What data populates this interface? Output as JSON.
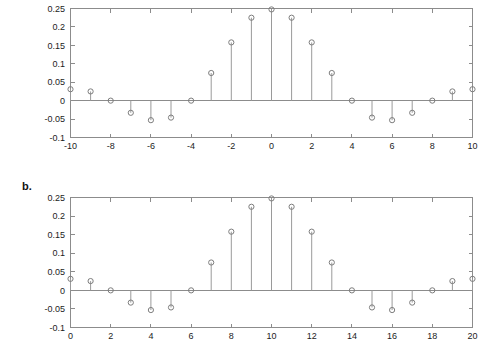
{
  "figure": {
    "background": "#ffffff",
    "axis_color": "#8c8c8c",
    "stem_color": "#9a9a9a",
    "marker_color": "#7d7d7d",
    "text_color": "#1c1c1c"
  },
  "panels": [
    {
      "id": "panel-a",
      "label": "",
      "chart_index": 0
    },
    {
      "id": "panel-b",
      "label": "b.",
      "chart_index": 1
    }
  ],
  "chart_data": [
    {
      "type": "scatter",
      "subtype": "stem",
      "title": "",
      "xlabel": "",
      "ylabel": "",
      "xlim": [
        -10,
        10
      ],
      "ylim": [
        -0.1,
        0.25
      ],
      "grid": false,
      "legend": null,
      "xticks": [
        -10,
        -8,
        -6,
        -4,
        -2,
        0,
        2,
        4,
        6,
        8,
        10
      ],
      "xticklabels": [
        "-10",
        "-8",
        "-6",
        "-4",
        "-2",
        "0",
        "2",
        "4",
        "6",
        "8",
        "10"
      ],
      "xminorticks": [
        -9,
        -7,
        -5,
        -3,
        -1,
        1,
        3,
        5,
        7,
        9
      ],
      "yticks": [
        -0.1,
        -0.05,
        0,
        0.05,
        0.1,
        0.15,
        0.2,
        0.25
      ],
      "yticklabels": [
        "-0.1",
        "-0.05",
        "0",
        "0.05",
        "0.1",
        "0.15",
        "0.2",
        "0.25"
      ],
      "x": [
        -10,
        -9,
        -8,
        -7,
        -6,
        -5,
        -4,
        -3,
        -2,
        -1,
        0,
        1,
        2,
        3,
        4,
        5,
        6,
        7,
        8,
        9,
        10
      ],
      "values": [
        0.031,
        0.025,
        0.0,
        -0.033,
        -0.053,
        -0.046,
        0.0,
        0.075,
        0.158,
        0.225,
        0.2475,
        0.225,
        0.158,
        0.075,
        0.0,
        -0.046,
        -0.053,
        -0.033,
        0.0,
        0.025,
        0.031
      ]
    },
    {
      "type": "scatter",
      "subtype": "stem",
      "title": "",
      "xlabel": "",
      "ylabel": "",
      "xlim": [
        0,
        20
      ],
      "ylim": [
        -0.1,
        0.25
      ],
      "grid": false,
      "legend": null,
      "xticks": [
        0,
        2,
        4,
        6,
        8,
        10,
        12,
        14,
        16,
        18,
        20
      ],
      "xticklabels": [
        "0",
        "2",
        "4",
        "6",
        "8",
        "10",
        "12",
        "14",
        "16",
        "18",
        "20"
      ],
      "xminorticks": [
        1,
        3,
        5,
        7,
        9,
        11,
        13,
        15,
        17,
        19
      ],
      "yticks": [
        -0.1,
        -0.05,
        0,
        0.05,
        0.1,
        0.15,
        0.2,
        0.25
      ],
      "yticklabels": [
        "-0.1",
        "-0.05",
        "0",
        "0.05",
        "0.1",
        "0.15",
        "0.2",
        "0.25"
      ],
      "x": [
        0,
        1,
        2,
        3,
        4,
        5,
        6,
        7,
        8,
        9,
        10,
        11,
        12,
        13,
        14,
        15,
        16,
        17,
        18,
        19,
        20
      ],
      "values": [
        0.031,
        0.025,
        0.0,
        -0.033,
        -0.053,
        -0.046,
        0.0,
        0.075,
        0.158,
        0.225,
        0.2475,
        0.225,
        0.158,
        0.075,
        0.0,
        -0.046,
        -0.053,
        -0.033,
        0.0,
        0.025,
        0.031
      ]
    }
  ]
}
